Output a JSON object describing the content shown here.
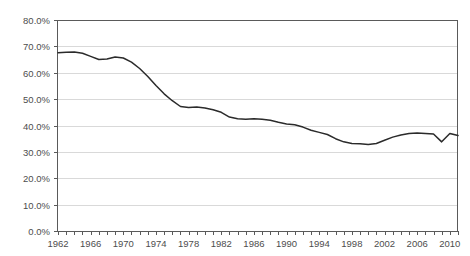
{
  "chart_data": {
    "type": "line",
    "title": "",
    "xlabel": "",
    "ylabel": "",
    "ylim": [
      0,
      80
    ],
    "ytick_labels": [
      "80.0%",
      "70.0%",
      "60.0%",
      "50.0%",
      "40.0%",
      "30.0%",
      "20.0%",
      "10.0%",
      "0.0%"
    ],
    "ytick_values": [
      80,
      70,
      60,
      50,
      40,
      30,
      20,
      10,
      0
    ],
    "xlim": [
      1962,
      2011
    ],
    "xtick_labels": [
      "1962",
      "1966",
      "1970",
      "1974",
      "1978",
      "1982",
      "1986",
      "1990",
      "1994",
      "1998",
      "2002",
      "2006",
      "2010"
    ],
    "xtick_values": [
      1962,
      1966,
      1970,
      1974,
      1978,
      1982,
      1986,
      1990,
      1994,
      1998,
      2002,
      2006,
      2010
    ],
    "minor_tick_interval": 1,
    "grid": "horizontal",
    "legend": "none",
    "series": [
      {
        "name": "Percent",
        "color": "#2b2b2b",
        "x": [
          1962,
          1963,
          1964,
          1965,
          1966,
          1967,
          1968,
          1969,
          1970,
          1971,
          1972,
          1973,
          1974,
          1975,
          1976,
          1977,
          1978,
          1979,
          1980,
          1981,
          1982,
          1983,
          1984,
          1985,
          1986,
          1987,
          1988,
          1989,
          1990,
          1991,
          1992,
          1993,
          1994,
          1995,
          1996,
          1997,
          1998,
          1999,
          2000,
          2001,
          2002,
          2003,
          2004,
          2005,
          2006,
          2007,
          2008,
          2009,
          2010,
          2011
        ],
        "values": [
          67.6,
          67.8,
          67.9,
          67.4,
          66.2,
          65.0,
          65.2,
          66.0,
          65.6,
          64.0,
          61.6,
          58.6,
          55.2,
          52.0,
          49.4,
          47.2,
          46.8,
          47.0,
          46.6,
          46.0,
          45.0,
          43.2,
          42.6,
          42.4,
          42.6,
          42.4,
          42.0,
          41.2,
          40.6,
          40.3,
          39.4,
          38.2,
          37.4,
          36.6,
          35.0,
          33.8,
          33.2,
          33.1,
          32.8,
          33.2,
          34.4,
          35.6,
          36.4,
          37.0,
          37.2,
          37.0,
          36.8,
          33.8,
          37.0,
          36.2
        ]
      }
    ]
  }
}
